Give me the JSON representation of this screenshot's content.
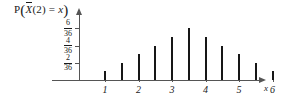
{
  "chart_data": {
    "type": "bar",
    "title_parts": {
      "p": "P",
      "open_paren": "(",
      "xbar": "X",
      "arg": "(2)",
      "equals": "=",
      "var": "x",
      "close_paren": ")"
    },
    "xlabel": "x",
    "ylabel": "",
    "grid": false,
    "legend": false,
    "xlim": [
      0.5,
      6.6
    ],
    "ylim": [
      0,
      0.1944
    ],
    "categories": [
      "1",
      "1.5",
      "2",
      "2.5",
      "3",
      "3.5",
      "4",
      "4.5",
      "5",
      "5.5",
      "6"
    ],
    "x": [
      1,
      1.5,
      2,
      2.5,
      3,
      3.5,
      4,
      4.5,
      5,
      5.5,
      6
    ],
    "values": [
      0.0278,
      0.0556,
      0.0833,
      0.1111,
      0.1389,
      0.1667,
      0.1389,
      0.1111,
      0.0833,
      0.0556,
      0.0278
    ],
    "value_fractions": [
      "1/36",
      "2/36",
      "3/36",
      "4/36",
      "5/36",
      "6/36",
      "5/36",
      "4/36",
      "3/36",
      "2/36",
      "1/36"
    ],
    "value_numerators": [
      1,
      2,
      3,
      4,
      5,
      6,
      5,
      4,
      3,
      2,
      1
    ],
    "denominator": 36,
    "ytick_labels": [
      "2/36",
      "4/36",
      "6/36"
    ],
    "ytick_values": [
      0.0556,
      0.1111,
      0.1667
    ],
    "ytick_numerators": [
      2,
      4,
      6
    ],
    "xtick_labels": [
      "1",
      "2",
      "3",
      "4",
      "5",
      "6"
    ],
    "xtick_values": [
      1,
      2,
      3,
      4,
      5,
      6
    ],
    "axis_color": "#555555",
    "bar_color": "#171717",
    "text_color": "#1a1a1a",
    "background": "#ffffff"
  }
}
